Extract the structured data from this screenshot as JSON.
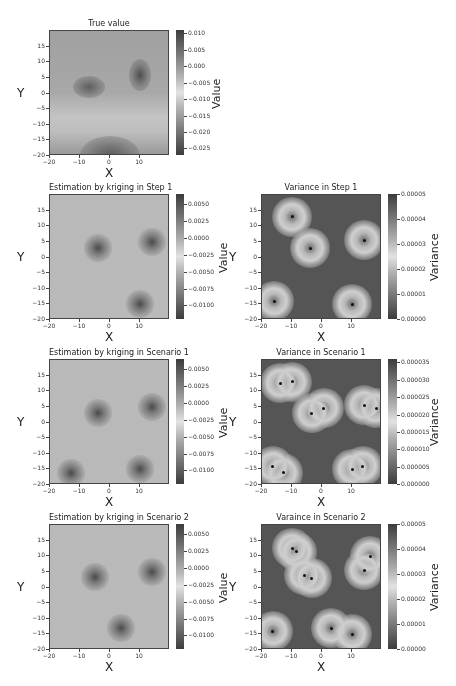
{
  "chart_data": [
    {
      "type": "heatmap",
      "title": "True value",
      "xlabel": "X",
      "ylabel": "Y",
      "colorbar_label": "Value",
      "xlim": [
        -20,
        20
      ],
      "ylim": [
        -20,
        20
      ],
      "xticks": [
        "−20",
        "−10",
        "0",
        "10"
      ],
      "yticks": [
        "15",
        "10",
        "5",
        "0",
        "−5",
        "−10",
        "−15",
        "−20"
      ],
      "colorbar_ticks": [
        "0.010",
        "0.005",
        "0.000",
        "−0.005",
        "−0.010",
        "−0.015",
        "−0.020",
        "−0.025"
      ],
      "colorbar_range": [
        -0.027,
        0.011
      ],
      "features": [
        {
          "x": -7,
          "y": 2,
          "kind": "high"
        },
        {
          "x": 10,
          "y": 6,
          "kind": "high"
        },
        {
          "x": 0,
          "y": -19,
          "kind": "low"
        }
      ]
    },
    {
      "type": "heatmap",
      "title": "Estimation by kriging in Step 1",
      "xlabel": "X",
      "ylabel": "Y",
      "colorbar_label": "Value",
      "xlim": [
        -20,
        20
      ],
      "ylim": [
        -20,
        20
      ],
      "xticks": [
        "−20",
        "−10",
        "0",
        "10"
      ],
      "yticks": [
        "15",
        "10",
        "5",
        "0",
        "−5",
        "−10",
        "−15",
        "−20"
      ],
      "colorbar_ticks": [
        "0.0050",
        "0.0025",
        "0.0000",
        "−0.0025",
        "−0.0050",
        "−0.0075",
        "−0.0100"
      ],
      "colorbar_range": [
        -0.012,
        0.0065
      ],
      "features": [
        {
          "x": -4,
          "y": 3
        },
        {
          "x": 14,
          "y": 5
        },
        {
          "x": 10,
          "y": -15
        }
      ]
    },
    {
      "type": "heatmap",
      "title": "Variance in Step 1",
      "xlabel": "X",
      "ylabel": "Y",
      "colorbar_label": "Variance",
      "xlim": [
        -20,
        20
      ],
      "ylim": [
        -20,
        20
      ],
      "xticks": [
        "−20",
        "−10",
        "0",
        "10"
      ],
      "yticks": [
        "15",
        "10",
        "5",
        "0",
        "−5",
        "−10",
        "−15",
        "−20"
      ],
      "colorbar_ticks": [
        "0.00005",
        "0.00004",
        "0.00003",
        "0.00002",
        "0.00001",
        "0.00000"
      ],
      "colorbar_range": [
        0,
        5e-05
      ],
      "sample_points": [
        {
          "x": -10,
          "y": 13
        },
        {
          "x": -4,
          "y": 3
        },
        {
          "x": 14,
          "y": 5.5
        },
        {
          "x": -16,
          "y": -14
        },
        {
          "x": 10,
          "y": -15
        }
      ]
    },
    {
      "type": "heatmap",
      "title": "Estimation by kriging in Scenario 1",
      "xlabel": "X",
      "ylabel": "Y",
      "colorbar_label": "Value",
      "xlim": [
        -20,
        20
      ],
      "ylim": [
        -20,
        20
      ],
      "xticks": [
        "−20",
        "−10",
        "0",
        "10"
      ],
      "yticks": [
        "15",
        "10",
        "5",
        "0",
        "−5",
        "−10",
        "−15",
        "−20"
      ],
      "colorbar_ticks": [
        "0.0050",
        "0.0025",
        "0.0000",
        "−0.0025",
        "−0.0050",
        "−0.0075",
        "−0.0100"
      ],
      "colorbar_range": [
        -0.012,
        0.0065
      ],
      "features": [
        {
          "x": -4,
          "y": 3
        },
        {
          "x": 14,
          "y": 5
        },
        {
          "x": 10,
          "y": -15
        },
        {
          "x": -13,
          "y": -16
        }
      ]
    },
    {
      "type": "heatmap",
      "title": "Variance in Scenario 1",
      "xlabel": "X",
      "ylabel": "Y",
      "colorbar_label": "Variance",
      "xlim": [
        -20,
        20
      ],
      "ylim": [
        -20,
        20
      ],
      "xticks": [
        "−20",
        "−10",
        "0",
        "10"
      ],
      "yticks": [
        "15",
        "10",
        "5",
        "0",
        "−5",
        "−10",
        "−15",
        "−20"
      ],
      "colorbar_ticks": [
        "0.000035",
        "0.000030",
        "0.000025",
        "0.000020",
        "0.000015",
        "0.000010",
        "0.000005",
        "0.000000"
      ],
      "colorbar_range": [
        0,
        3.6e-05
      ],
      "sample_points": [
        {
          "x": -14,
          "y": 12.5
        },
        {
          "x": -10,
          "y": 13
        },
        {
          "x": -3.5,
          "y": 3
        },
        {
          "x": 0.5,
          "y": 4.5
        },
        {
          "x": 14,
          "y": 5.5
        },
        {
          "x": 18,
          "y": 4.5
        },
        {
          "x": -16.5,
          "y": -14
        },
        {
          "x": -13,
          "y": -16
        },
        {
          "x": 10,
          "y": -15
        },
        {
          "x": 13.5,
          "y": -14
        }
      ]
    },
    {
      "type": "heatmap",
      "title": "Estimation by kriging in Scenario 2",
      "xlabel": "X",
      "ylabel": "Y",
      "colorbar_label": "Value",
      "xlim": [
        -20,
        20
      ],
      "ylim": [
        -20,
        20
      ],
      "xticks": [
        "−20",
        "−10",
        "0",
        "10"
      ],
      "yticks": [
        "15",
        "10",
        "5",
        "0",
        "−5",
        "−10",
        "−15",
        "−20"
      ],
      "colorbar_ticks": [
        "0.0050",
        "0.0025",
        "0.0000",
        "−0.0025",
        "−0.0050",
        "−0.0075",
        "−0.0100"
      ],
      "colorbar_range": [
        -0.012,
        0.0065
      ],
      "features": [
        {
          "x": -5,
          "y": 3.5
        },
        {
          "x": 14,
          "y": 5
        },
        {
          "x": 3.5,
          "y": -13
        }
      ]
    },
    {
      "type": "heatmap",
      "title": "Varaince in Scenario 2",
      "xlabel": "X",
      "ylabel": "Y",
      "colorbar_label": "Variance",
      "xlim": [
        -20,
        20
      ],
      "ylim": [
        -20,
        20
      ],
      "xticks": [
        "−20",
        "−10",
        "0",
        "10"
      ],
      "yticks": [
        "15",
        "10",
        "5",
        "0",
        "−5",
        "−10",
        "−15",
        "−20"
      ],
      "colorbar_ticks": [
        "0.00005",
        "0.00004",
        "0.00003",
        "0.00002",
        "0.00001",
        "0.00000"
      ],
      "colorbar_range": [
        0,
        5e-05
      ],
      "sample_points": [
        {
          "x": -10,
          "y": 12.5
        },
        {
          "x": -8.5,
          "y": 11.5
        },
        {
          "x": -6,
          "y": 4
        },
        {
          "x": -3.5,
          "y": 3
        },
        {
          "x": 14,
          "y": 5.5
        },
        {
          "x": 16,
          "y": 10
        },
        {
          "x": -16.5,
          "y": -14
        },
        {
          "x": 3,
          "y": -13
        },
        {
          "x": 10,
          "y": -15
        }
      ]
    }
  ]
}
